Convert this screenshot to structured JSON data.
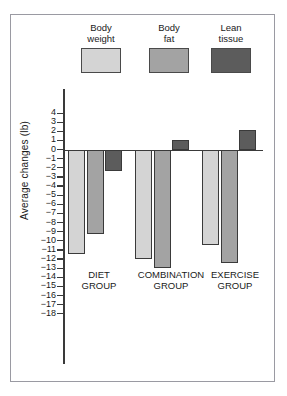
{
  "chart_data": {
    "type": "bar",
    "title": "",
    "xlabel": "",
    "ylabel": "Average changes (lb)",
    "categories": [
      "DIET\nGROUP",
      "COMBINATION\nGROUP",
      "EXERCISE\nGROUP"
    ],
    "series": [
      {
        "name": "Body\nweight",
        "legend_label": "Body weight",
        "color": "#d4d4d4",
        "values": [
          -11.4,
          -12.0,
          -10.5
        ]
      },
      {
        "name": "Body\nfat",
        "legend_label": "Body fat",
        "color": "#a3a3a3",
        "values": [
          -9.3,
          -13.0,
          -12.4
        ]
      },
      {
        "name": "Lean\ntissue",
        "legend_label": "Lean tissue",
        "color": "#5c5c5c",
        "values": [
          -2.4,
          1.1,
          2.2
        ]
      }
    ],
    "ylim": [
      -18,
      4
    ],
    "yticks": [
      4,
      3,
      2,
      1,
      0,
      -1,
      -2,
      -3,
      -4,
      -5,
      -6,
      -7,
      -8,
      -9,
      -10,
      -11,
      -12,
      -13,
      -14,
      -15,
      -16,
      -17,
      -18
    ],
    "ytick_labels": [
      "4",
      "3",
      "2",
      "1",
      "0",
      "−1",
      "−2",
      "−3",
      "−4",
      "−5",
      "−6",
      "−7",
      "−8",
      "−9",
      "−10",
      "−11",
      "−12",
      "−13",
      "−14",
      "−15",
      "−16",
      "−17",
      "−18"
    ],
    "grid": false,
    "legend_position": "top",
    "axis_color": "#3a3a3a",
    "bar_border_color": "#3a3a3a",
    "frame_color": "#9a9aa2"
  },
  "legend": {
    "items": [
      {
        "label": "Body\nweight",
        "color": "#d4d4d4"
      },
      {
        "label": "Body\nfat",
        "color": "#a3a3a3"
      },
      {
        "label": "Lean\ntissue",
        "color": "#5c5c5c"
      }
    ]
  }
}
